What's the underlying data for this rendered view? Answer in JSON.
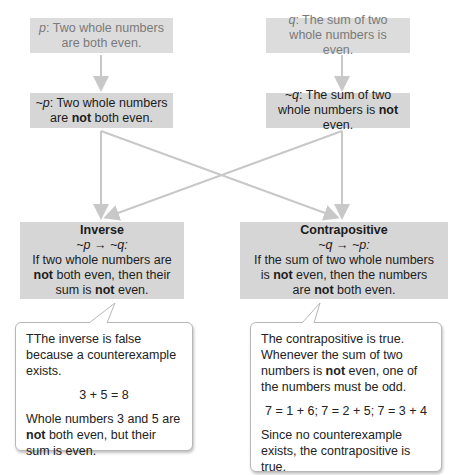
{
  "statements": {
    "p": {
      "symbol": "p",
      "text": ": Two whole numbers are both even."
    },
    "q": {
      "symbol": "q",
      "text": ": The sum of two whole numbers is even."
    },
    "not_p": {
      "symbol": "~p",
      "text_before": ": Two whole numbers are ",
      "bold": "not",
      "text_after": " both even."
    },
    "not_q": {
      "symbol": "~q",
      "text_before": ": The sum of two whole numbers is ",
      "bold": "not",
      "text_after": " even."
    }
  },
  "inverse": {
    "title": "Inverse",
    "form": "~p → ~q:",
    "line1": "If two whole numbers are",
    "bold1": "not",
    "line2": " both even, then their",
    "line3a": "sum is ",
    "bold2": "not",
    "line3b": " even."
  },
  "contrapositive": {
    "title": "Contrapositive",
    "form": "~q → ~p:",
    "line1": "If the sum of two whole numbers",
    "line2a": "is ",
    "bold1": "not",
    "line2b": " even, then the numbers",
    "line3a": "are ",
    "bold2": "not",
    "line3b": " both even."
  },
  "inverse_note": {
    "intro": "TThe inverse is false because a counterexample exists.",
    "equation": "3 + 5 = 8",
    "bold": "not",
    "text_a": "Whole numbers 3 and 5 are ",
    "text_b": " both even, but their sum is even."
  },
  "contrapositive_note": {
    "intro_a": "The contrapositive is true. Whenever the sum of two numbers is ",
    "bold": "not",
    "intro_b": " even, one of the numbers must be odd.",
    "equation": "7 = 1 + 6; 7 = 2 + 5; 7 = 3 + 4",
    "conclusion": "Since no counterexample exists, the contrapositive is true."
  },
  "colors": {
    "box_fill": "#d6d6d6",
    "top_box_text": "#7a7a7a",
    "arrow": "#c8c8c8"
  }
}
